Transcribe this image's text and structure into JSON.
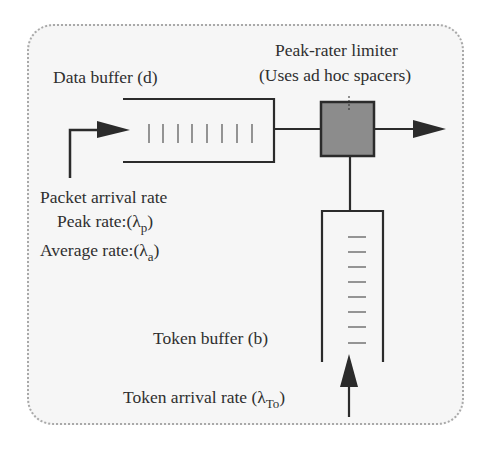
{
  "diagram": {
    "labels": {
      "data_buffer": "Data buffer (d)",
      "limiter_line1": "Peak-rater limiter",
      "limiter_line2": "(Uses ad hoc spacers)",
      "packet_arrival": "Packet arrival rate",
      "peak_rate_prefix": "Peak rate:(λ",
      "peak_rate_sub": "p",
      "peak_rate_suffix": ")",
      "avg_rate_prefix": "Average rate:(λ",
      "avg_rate_sub": "a",
      "avg_rate_suffix": ")",
      "token_buffer": "Token buffer (b)",
      "token_arrival_prefix": "Token arrival rate (λ",
      "token_arrival_sub": "To",
      "token_arrival_suffix": ")"
    },
    "data_buffer_slots": 8,
    "token_buffer_slots": 8,
    "colors": {
      "line": "#2b2b2b",
      "limiter_fill": "#8c8c8c",
      "frame_border": "#a9a9a9",
      "frame_bg": "#f6f6f6"
    }
  }
}
